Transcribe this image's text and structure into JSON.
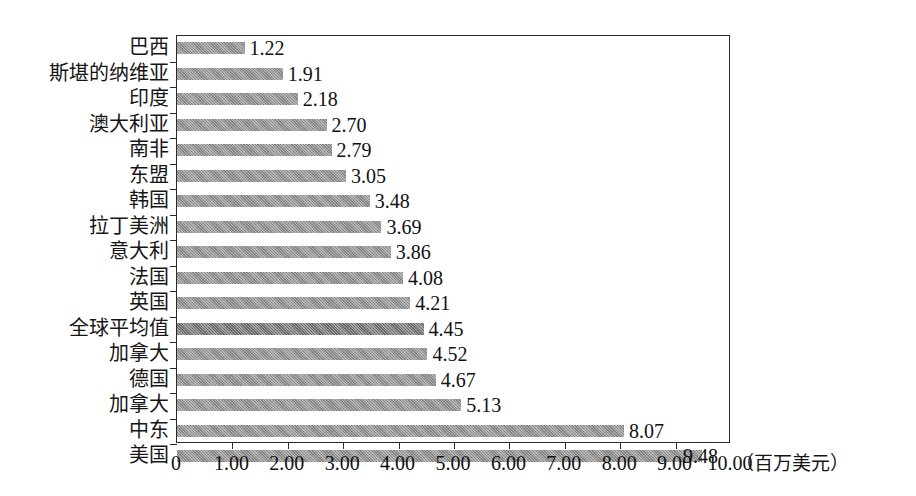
{
  "chart_data": {
    "type": "bar",
    "orientation": "horizontal",
    "title": "",
    "subtitle": "",
    "xlabel": "（百万美元）",
    "ylabel": "",
    "xlim": [
      0,
      10
    ],
    "ylim": null,
    "grid": false,
    "legend": null,
    "legend_position": "none",
    "xticks": [
      "0",
      "1.00",
      "2.00",
      "3.00",
      "4.00",
      "5.00",
      "6.00",
      "7.00",
      "8.00",
      "9.00",
      "10.00"
    ],
    "xtick_values": [
      0,
      1,
      2,
      3,
      4,
      5,
      6,
      7,
      8,
      9,
      10
    ],
    "unit_note": "（百万美元）",
    "categories": [
      "巴西",
      "斯堪的纳维亚",
      "印度",
      "澳大利亚",
      "南非",
      "东盟",
      "韩国",
      "拉丁美洲",
      "意大利",
      "法国",
      "英国",
      "全球平均值",
      "加拿大",
      "德国",
      "加拿大",
      "中东",
      "美国"
    ],
    "values": [
      1.22,
      1.91,
      2.18,
      2.7,
      2.79,
      3.05,
      3.48,
      3.69,
      3.86,
      4.08,
      4.21,
      4.45,
      4.52,
      4.67,
      5.13,
      8.07,
      9.48
    ],
    "value_labels": [
      "1.22",
      "1.91",
      "2.18",
      "2.70",
      "2.79",
      "3.05",
      "3.48",
      "3.69",
      "3.86",
      "4.08",
      "4.21",
      "4.45",
      "4.52",
      "4.67",
      "5.13",
      "8.07",
      "9.48"
    ],
    "highlight_index": 11,
    "colors": {
      "bar": "#8d8d8d",
      "bar_highlight": "#6f6f6f",
      "axis": "#2a2a2a",
      "text": "#111111",
      "background": "#ffffff"
    }
  }
}
